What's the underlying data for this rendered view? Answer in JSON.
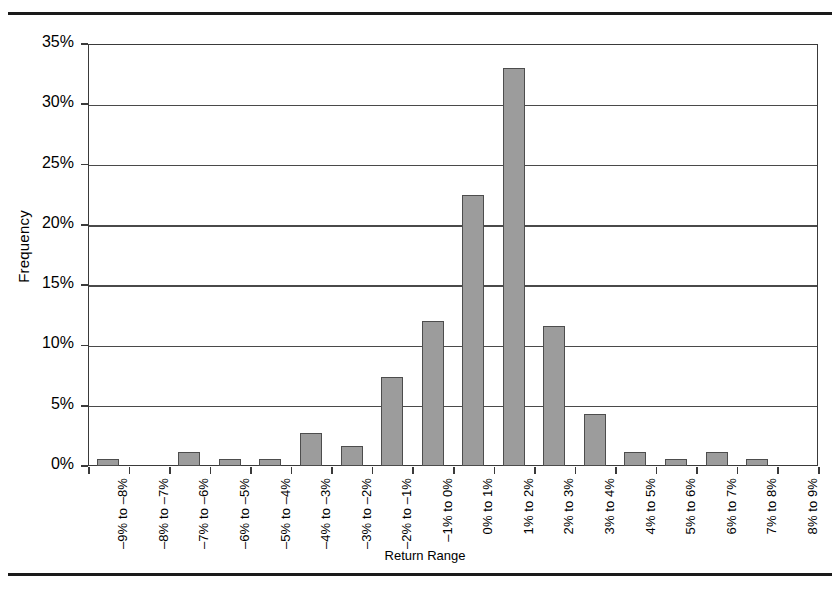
{
  "chart_data": {
    "type": "bar",
    "title": "",
    "xlabel": "Return Range",
    "ylabel": "Frequency",
    "ylim": [
      0,
      35
    ],
    "ytick_labels": [
      "35%",
      "30%",
      "25%",
      "20%",
      "15%",
      "10%",
      "5%",
      "0%"
    ],
    "ytick_values": [
      35,
      30,
      25,
      20,
      15,
      10,
      5,
      0
    ],
    "grid": "horizontal",
    "legend": "none",
    "categories": [
      "–9% to –8%",
      "–8% to –7%",
      "–7% to –6%",
      "–6% to –5%",
      "–5% to –4%",
      "–4% to –3%",
      "–3% to –2%",
      "–2% to –1%",
      "–1% to 0%",
      "0% to 1%",
      "1% to 2%",
      "2% to 3%",
      "3% to 4%",
      "4% to 5%",
      "5% to 6%",
      "6% to 7%",
      "7% to 8%",
      "8% to 9%"
    ],
    "values": [
      0.6,
      0.0,
      1.2,
      0.6,
      0.6,
      2.7,
      1.7,
      7.4,
      12.0,
      22.5,
      33.0,
      11.6,
      4.3,
      1.2,
      0.6,
      1.2,
      0.6,
      0.0
    ],
    "bar_color": "#9c9c9c",
    "bar_edge_color": "#4d4d4d",
    "axis_color": "#3a3a3a"
  }
}
